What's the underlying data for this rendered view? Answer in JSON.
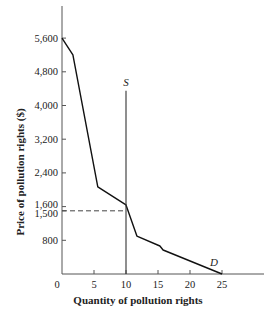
{
  "chart_data": {
    "type": "line",
    "title": "",
    "xlabel": "Quantity of pollution rights",
    "ylabel": "Price of pollution rights ($)",
    "xlim": [
      0,
      28
    ],
    "ylim": [
      0,
      6600
    ],
    "x_ticks": [
      0,
      5,
      10,
      15,
      20,
      25
    ],
    "x_tick_labels": [
      "0",
      "5",
      "10",
      "15",
      "20",
      "25"
    ],
    "y_ticks": [
      800,
      1500,
      1600,
      2400,
      3200,
      4000,
      4800,
      5600
    ],
    "y_tick_labels": [
      "800",
      "1,500",
      "1,600",
      "2,400",
      "3,200",
      "4,000",
      "4,800",
      "5,600"
    ],
    "grid": false,
    "legend": "none",
    "series": [
      {
        "name": "D",
        "label": "D",
        "style": "solid",
        "points": [
          {
            "x": 0,
            "y": 5600
          },
          {
            "x": 1.7,
            "y": 5200
          },
          {
            "x": 5.6,
            "y": 2070
          },
          {
            "x": 10,
            "y": 1640
          },
          {
            "x": 11.7,
            "y": 900
          },
          {
            "x": 15.3,
            "y": 665
          },
          {
            "x": 15.8,
            "y": 570
          },
          {
            "x": 25,
            "y": 0
          }
        ]
      },
      {
        "name": "S",
        "label": "S",
        "style": "solid-vertical",
        "points": [
          {
            "x": 10,
            "y": 0
          },
          {
            "x": 10,
            "y": 4350
          }
        ]
      }
    ],
    "annotations": [
      {
        "type": "dashed-hline",
        "y": 1500,
        "x_from": 0,
        "x_to": 10,
        "label": "1,500"
      }
    ]
  }
}
